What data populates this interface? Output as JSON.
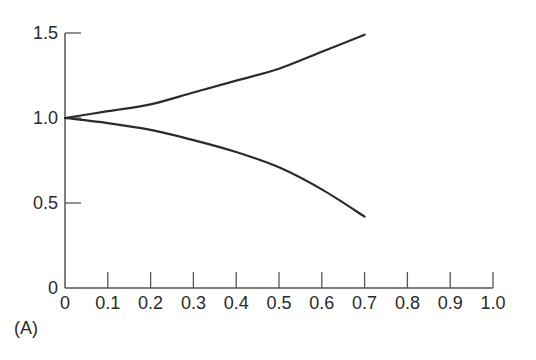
{
  "panel_label": "(A)",
  "colors": {
    "axis": "#555555",
    "curve": "#2b2b2b",
    "text": "#2a2a2a"
  },
  "chart_data": {
    "type": "line",
    "title": "",
    "xlabel": "",
    "ylabel": "",
    "xlim": [
      0,
      1.0
    ],
    "ylim": [
      0,
      1.5
    ],
    "grid": false,
    "legend": null,
    "x_ticks": [
      0,
      0.1,
      0.2,
      0.3,
      0.4,
      0.5,
      0.6,
      0.7,
      0.8,
      0.9,
      1.0
    ],
    "x_tick_labels": [
      "0",
      "0.1",
      "0.2",
      "0.3",
      "0.4",
      "0.5",
      "0.6",
      "0.7",
      "0.8",
      "0.9",
      "1.0"
    ],
    "y_ticks": [
      0,
      0.5,
      1.0,
      1.5
    ],
    "y_tick_labels": [
      "0",
      "0.5",
      "1.0",
      "1.5"
    ],
    "series": [
      {
        "name": "upper",
        "x": [
          0,
          0.1,
          0.2,
          0.3,
          0.4,
          0.5,
          0.6,
          0.7
        ],
        "values": [
          1.0,
          1.04,
          1.08,
          1.15,
          1.22,
          1.29,
          1.39,
          1.49
        ]
      },
      {
        "name": "lower",
        "x": [
          0,
          0.1,
          0.2,
          0.3,
          0.4,
          0.5,
          0.6,
          0.7
        ],
        "values": [
          1.0,
          0.97,
          0.93,
          0.87,
          0.8,
          0.71,
          0.58,
          0.42
        ]
      }
    ],
    "annotations": [
      "(A)"
    ]
  }
}
